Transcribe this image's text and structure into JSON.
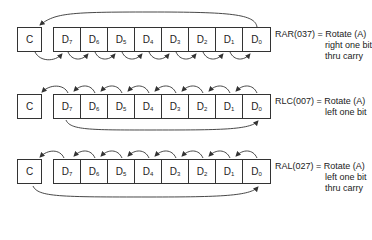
{
  "diagram": {
    "rows": [
      {
        "id": "rar",
        "instruction": "RAR(037)",
        "description_lines": [
          "= Rotate (A)",
          "right one bit",
          "thru carry"
        ],
        "carry_label": "C",
        "bits": [
          {
            "base": "D",
            "sub": "7"
          },
          {
            "base": "D",
            "sub": "6"
          },
          {
            "base": "D",
            "sub": "5"
          },
          {
            "base": "D",
            "sub": "4"
          },
          {
            "base": "D",
            "sub": "3"
          },
          {
            "base": "D",
            "sub": "2"
          },
          {
            "base": "D",
            "sub": "1"
          },
          {
            "base": "D",
            "sub": "0"
          }
        ]
      },
      {
        "id": "rlc",
        "instruction": "RLC(007)",
        "description_lines": [
          "= Rotate (A)",
          "left one bit"
        ],
        "carry_label": "C",
        "bits": [
          {
            "base": "D",
            "sub": "7"
          },
          {
            "base": "D",
            "sub": "6"
          },
          {
            "base": "D",
            "sub": "5"
          },
          {
            "base": "D",
            "sub": "4"
          },
          {
            "base": "D",
            "sub": "3"
          },
          {
            "base": "D",
            "sub": "2"
          },
          {
            "base": "D",
            "sub": "1"
          },
          {
            "base": "D",
            "sub": "0"
          }
        ]
      },
      {
        "id": "ral",
        "instruction": "RAL(027)",
        "description_lines": [
          "= Rotate (A)",
          "left one bit",
          "thru carry"
        ],
        "carry_label": "C",
        "bits": [
          {
            "base": "D",
            "sub": "7"
          },
          {
            "base": "D",
            "sub": "6"
          },
          {
            "base": "D",
            "sub": "5"
          },
          {
            "base": "D",
            "sub": "4"
          },
          {
            "base": "D",
            "sub": "3"
          },
          {
            "base": "D",
            "sub": "2"
          },
          {
            "base": "D",
            "sub": "1"
          },
          {
            "base": "D",
            "sub": "0"
          }
        ]
      }
    ]
  }
}
